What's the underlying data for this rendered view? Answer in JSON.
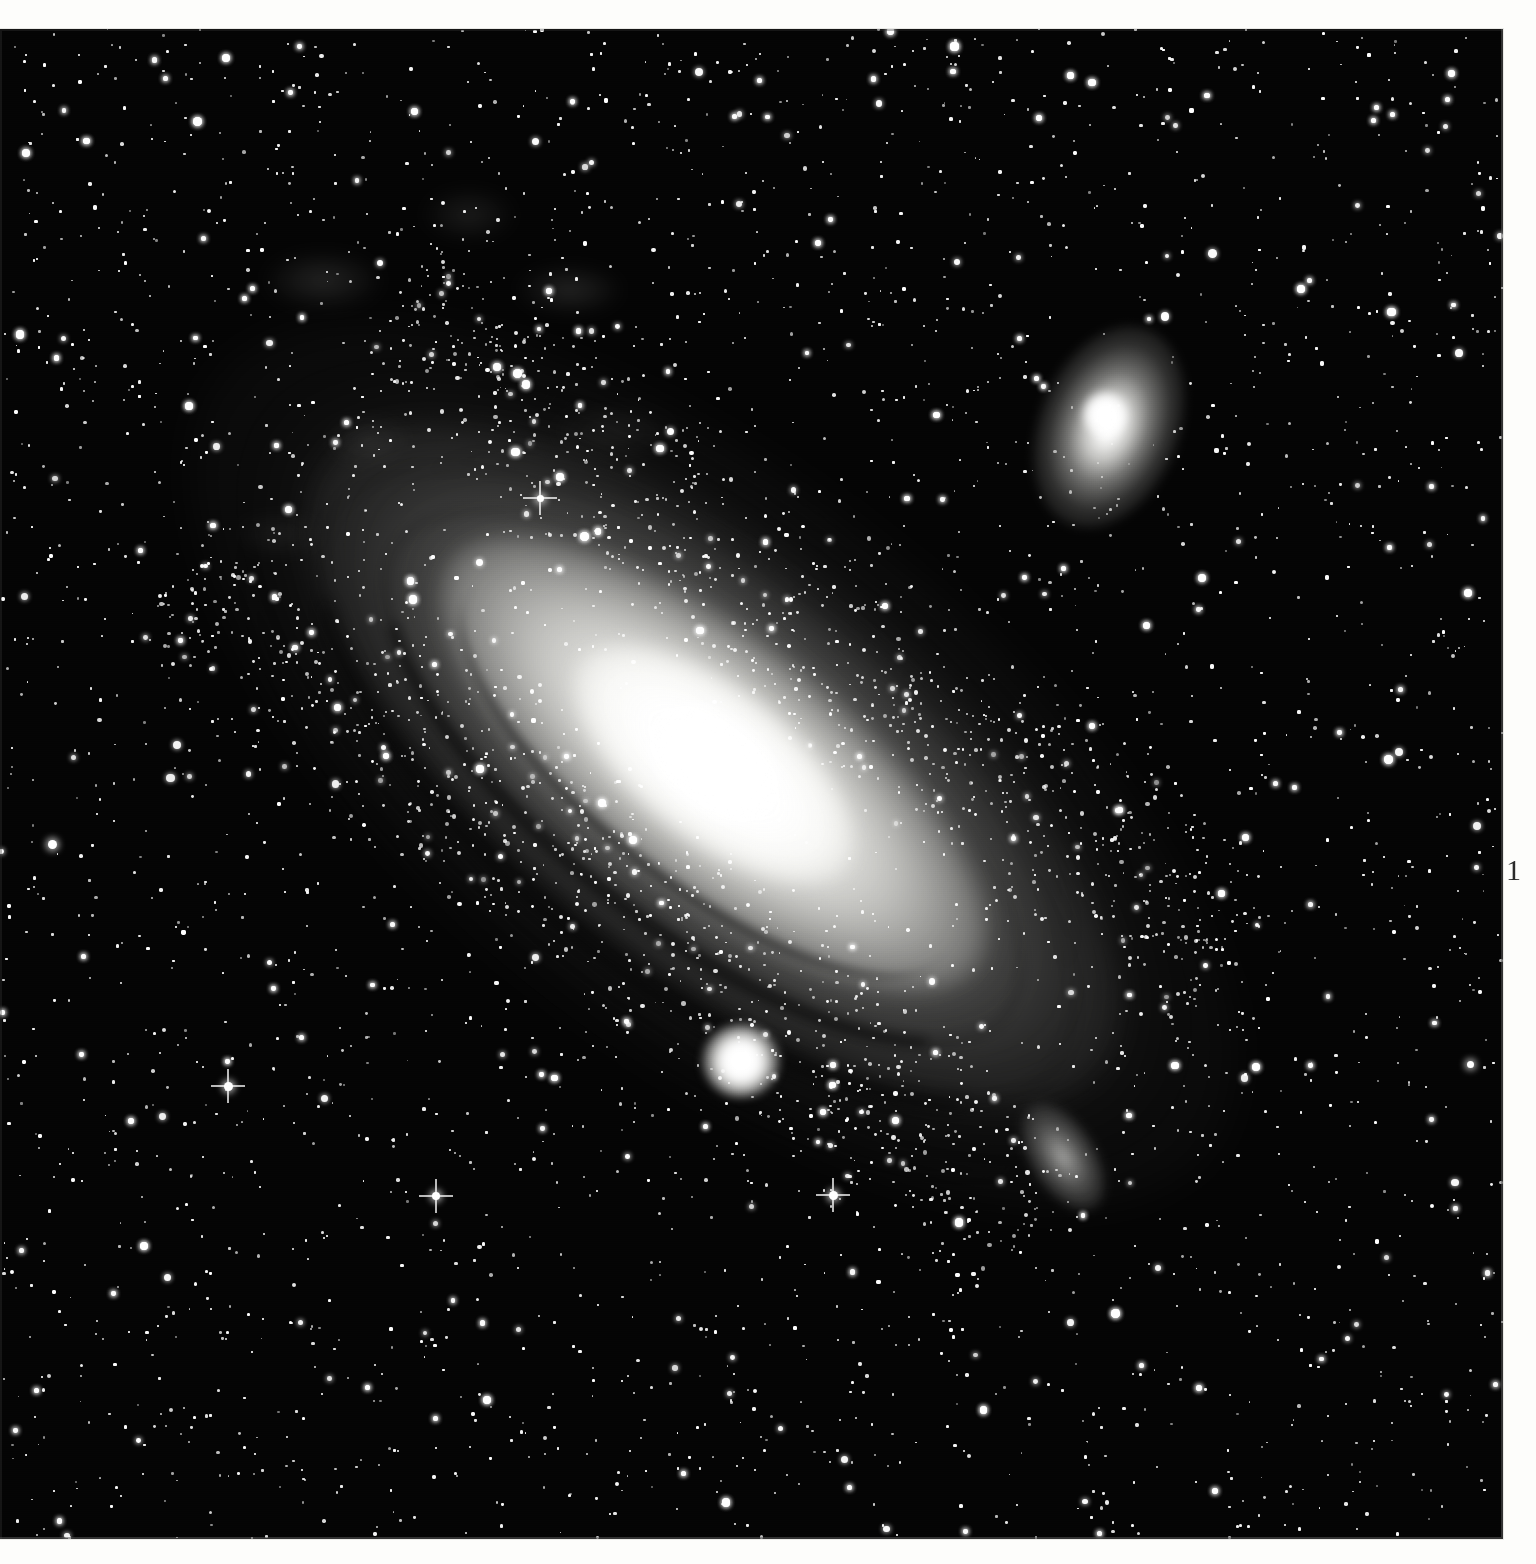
{
  "page": {
    "background_color": "#fdfdfb",
    "page_number": "1"
  },
  "plate": {
    "title": "Andromeda Galaxy photographic plate",
    "sky_color": "#040404",
    "star_color": "#ffffff",
    "objects": [
      {
        "name": "M31 Andromeda Galaxy",
        "kind": "spiral-galaxy",
        "x": 720,
        "y": 730,
        "position_angle_deg": 38
      },
      {
        "name": "M32",
        "kind": "compact-elliptical-galaxy",
        "x": 741,
        "y": 1032
      },
      {
        "name": "M110 NGC 205",
        "kind": "dwarf-elliptical-galaxy",
        "x": 1109,
        "y": 398
      },
      {
        "name": "NGC 206 star cloud",
        "kind": "star-cloud",
        "x": 1063,
        "y": 1128
      }
    ],
    "bright_stars": [
      {
        "x": 228,
        "y": 1057,
        "size": 9,
        "spikes": true
      },
      {
        "x": 436,
        "y": 1167,
        "size": 8,
        "spikes": true
      },
      {
        "x": 833,
        "y": 1166,
        "size": 9,
        "spikes": true
      },
      {
        "x": 540,
        "y": 469,
        "size": 7,
        "spikes": true
      },
      {
        "x": 1470,
        "y": 1035,
        "size": 7,
        "spikes": false
      },
      {
        "x": 52,
        "y": 815,
        "size": 9,
        "spikes": false
      }
    ]
  }
}
